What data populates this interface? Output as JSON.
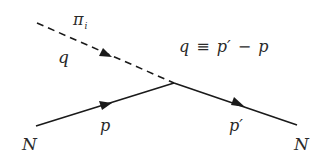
{
  "diagram": {
    "type": "feynman-diagram",
    "colors": {
      "line": "#1a1a1a",
      "text": "#2a2a2a",
      "background": "#ffffff"
    },
    "vertex": {
      "x": 174,
      "y": 83
    },
    "lines": [
      {
        "id": "pion",
        "style": "dashed",
        "from": [
          37,
          23
        ],
        "to": [
          174,
          83
        ],
        "arrow_at": [
          107,
          54
        ]
      },
      {
        "id": "nucleon-in",
        "style": "solid",
        "from": [
          36,
          126
        ],
        "to": [
          174,
          83
        ],
        "arrow_at": [
          107,
          104
        ]
      },
      {
        "id": "nucleon-out",
        "style": "solid",
        "from": [
          174,
          83
        ],
        "to": [
          297,
          125
        ],
        "arrow_at": [
          240,
          105
        ]
      }
    ],
    "labels": {
      "pion_symbol": "π",
      "pion_subscript": "i",
      "pion_momentum": "q",
      "relation_lhs": "q",
      "relation_equiv": "≡",
      "relation_rhs_p_prime": "p′",
      "relation_minus": "−",
      "relation_rhs_p": "p",
      "nucleon_in": "N",
      "nucleon_in_momentum": "p",
      "nucleon_out_momentum": "p′",
      "nucleon_out": "N"
    }
  }
}
